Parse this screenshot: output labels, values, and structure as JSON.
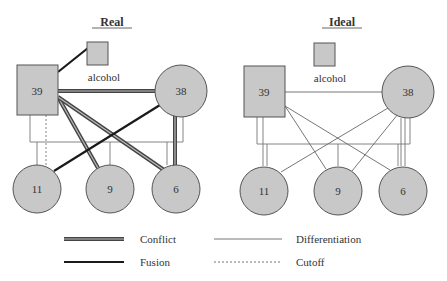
{
  "top_text": "Figure: Real vs Ideal family diagram",
  "diagrams": [
    {
      "title": "Real",
      "father": "39",
      "mother": "38",
      "substance": "alcohol",
      "children": [
        "11",
        "9",
        "6"
      ]
    },
    {
      "title": "Ideal",
      "father": "39",
      "mother": "38",
      "substance": "alcohol",
      "children": [
        "11",
        "9",
        "6"
      ]
    }
  ],
  "legend": [
    {
      "style": "conflict",
      "label": "Conflict"
    },
    {
      "style": "differentiation",
      "label": "Differentiation"
    },
    {
      "style": "fusion",
      "label": "Fusion"
    },
    {
      "style": "cutoff",
      "label": "Cutoff"
    }
  ],
  "colors": {
    "node_fill": "#c8c8c8",
    "node_stroke": "#555555",
    "fusion": "#1a1a1a",
    "conflict_outer": "#444444",
    "conflict_inner": "#bbbbbb",
    "thin": "#666666"
  }
}
